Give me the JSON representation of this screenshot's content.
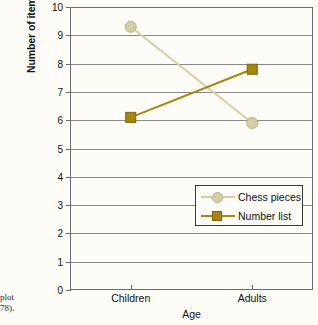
{
  "caption": {
    "fragment_line1": "plot",
    "fragment_line2": "78)."
  },
  "colors": {
    "chess_pieces": "#d5cda4",
    "number_list": "#a8860c",
    "gridline": "#8a8a8a",
    "frame": "#6e6e6e",
    "background": "#fdfcf7",
    "text": "#111111"
  },
  "chart_data": {
    "type": "line",
    "title": "",
    "xlabel": "Age",
    "ylabel": "Number of items recalled",
    "categories": [
      "Children",
      "Adults"
    ],
    "series": [
      {
        "name": "Chess pieces",
        "values": [
          9.3,
          5.9
        ],
        "marker": "circle",
        "color": "#d5cda4"
      },
      {
        "name": "Number list",
        "values": [
          6.1,
          7.8
        ],
        "marker": "square",
        "color": "#a8860c"
      }
    ],
    "ylim": [
      0,
      10
    ],
    "ytick_labels": [
      "10",
      "9",
      "8",
      "7",
      "6",
      "5",
      "4",
      "3",
      "2",
      "1",
      "0"
    ],
    "ytick_values": [
      10,
      9,
      8,
      7,
      6,
      5,
      4,
      3,
      2,
      1,
      0
    ],
    "grid": true,
    "grid_axis": "y",
    "legend_position": "lower-right-inside"
  }
}
